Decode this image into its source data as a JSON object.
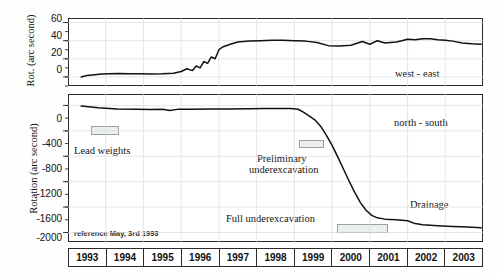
{
  "figure": {
    "top_panel": {
      "ylabel": "Rot. (arc second)",
      "series_label": "west - east",
      "yticks": [
        "60",
        "40",
        "20",
        "0"
      ]
    },
    "bottom_panel": {
      "ylabel": "Rotation (arc second)",
      "series_label": "north - south",
      "yticks": [
        "0",
        "-400",
        "-800",
        "-1200",
        "-1600",
        "-2000"
      ],
      "annotations": {
        "lead_weights": "Lead weights",
        "preliminary": "Preliminary\nunderexcavation",
        "preliminary_line1": "Preliminary",
        "preliminary_line2": "underexcavation",
        "full": "Full underexcavation",
        "drainage": "Drainage",
        "reference": "reference May, 3rd 1993"
      }
    },
    "xaxis": {
      "years": [
        "1993",
        "1994",
        "1995",
        "1996",
        "1997",
        "1998",
        "1999",
        "2000",
        "2001",
        "2002",
        "2003"
      ]
    }
  },
  "chart_data": {
    "type": "line",
    "title": "",
    "xlabel": "",
    "panels": [
      {
        "name": "top",
        "ylabel": "Rot. (arc second)",
        "series_name": "west - east",
        "ylim": [
          -10,
          65
        ],
        "yticks": [
          0,
          20,
          40,
          60
        ],
        "xlim": [
          1993.0,
          2004.0
        ],
        "grid": true,
        "x": [
          1993.35,
          1993.5,
          1993.7,
          1993.9,
          1994.1,
          1994.35,
          1994.6,
          1994.9,
          1995.2,
          1995.5,
          1995.8,
          1996.0,
          1996.15,
          1996.3,
          1996.4,
          1996.5,
          1996.6,
          1996.7,
          1996.8,
          1996.9,
          1997.0,
          1997.1,
          1997.3,
          1997.5,
          1997.8,
          1998.1,
          1998.4,
          1998.7,
          1999.0,
          1999.3,
          1999.6,
          1999.9,
          2000.2,
          2000.5,
          2000.8,
          2001.0,
          2001.2,
          2001.4,
          2001.55,
          2001.7,
          2001.85,
          2002.0,
          2002.2,
          2002.4,
          2002.6,
          2002.8,
          2003.0,
          2003.2,
          2003.45,
          2003.7,
          2003.95
        ],
        "y": [
          0,
          1.5,
          2.5,
          3.2,
          3.6,
          3.8,
          3.6,
          3.5,
          3.3,
          3.4,
          4.0,
          6.0,
          9.0,
          7.0,
          12.0,
          10.0,
          17.0,
          15.0,
          22.0,
          20.0,
          30.0,
          33.0,
          36.0,
          38.5,
          39.5,
          40.0,
          40.5,
          40.5,
          40.0,
          39.5,
          38.0,
          34.5,
          34.0,
          35.0,
          39.0,
          36.0,
          40.0,
          37.5,
          38.0,
          38.5,
          40.0,
          41.5,
          41.0,
          42.0,
          42.0,
          41.0,
          40.5,
          39.5,
          37.5,
          36.5,
          36.0
        ]
      },
      {
        "name": "bottom",
        "ylabel": "Rotation (arc second)",
        "series_name": "north - south",
        "ylim": [
          -2150,
          180
        ],
        "yticks": [
          0,
          -400,
          -800,
          -1200,
          -1600,
          -2000
        ],
        "xlim": [
          1993.0,
          2004.0
        ],
        "grid": true,
        "x": [
          1993.35,
          1993.8,
          1994.3,
          1994.8,
          1995.2,
          1995.5,
          1995.7,
          1995.9,
          1996.3,
          1996.8,
          1997.3,
          1997.8,
          1998.2,
          1998.6,
          1998.9,
          1999.1,
          1999.25,
          1999.4,
          1999.55,
          1999.7,
          1999.85,
          2000.0,
          2000.15,
          2000.3,
          2000.45,
          2000.6,
          2000.75,
          2000.9,
          2001.05,
          2001.2,
          2001.4,
          2001.7,
          2002.0,
          2002.2,
          2002.4,
          2002.8,
          2003.2,
          2003.6,
          2003.95
        ],
        "y": [
          -10,
          -35,
          -55,
          -62,
          -65,
          -60,
          -80,
          -62,
          -60,
          -58,
          -55,
          -52,
          -50,
          -48,
          -50,
          -60,
          -110,
          -170,
          -230,
          -330,
          -470,
          -630,
          -810,
          -1000,
          -1190,
          -1370,
          -1530,
          -1650,
          -1730,
          -1770,
          -1790,
          -1800,
          -1815,
          -1860,
          -1880,
          -1895,
          -1905,
          -1915,
          -1925
        ]
      }
    ],
    "events": [
      {
        "label": "Lead weights",
        "x_start": 1993.6,
        "x_end": 1994.1,
        "panel": "bottom"
      },
      {
        "label": "Preliminary underexcavation",
        "x_start": 1998.9,
        "x_end": 1999.5,
        "panel": "bottom"
      },
      {
        "label": "Full underexcavation",
        "x_start": 1999.8,
        "x_end": 2001.0,
        "panel": "bottom"
      },
      {
        "label": "Drainage",
        "x_start": 2002.0,
        "x_end": 2003.9,
        "panel": "bottom"
      }
    ]
  }
}
